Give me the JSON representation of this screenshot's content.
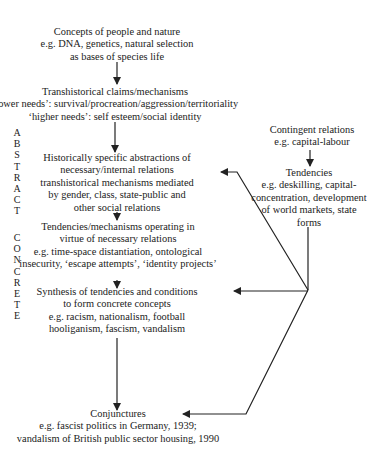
{
  "diagram": {
    "nodes": {
      "concepts": {
        "title": "Concepts of people and nature",
        "lines": [
          "e.g. DNA, genetics, natural selection",
          "as bases of species life"
        ]
      },
      "transhistorical": {
        "title": "Transhistorical claims/mechanisms",
        "lines": [
          "‘lower needs’: survival/procreation/aggression/territoriality",
          "‘higher needs’: self esteem/social identity"
        ]
      },
      "historically_specific": {
        "title": "Historically specific abstractions of",
        "lines": [
          "necessary/internal relations",
          "transhistorical mechanisms mediated",
          "by gender, class, state-public and",
          "other social relations"
        ]
      },
      "tendencies_mechanisms": {
        "title": "Tendencies/mechanisms operating in",
        "lines": [
          "virtue of necessary relations",
          "e.g. time-space distantiation, ontological",
          "insecurity, ‘escape attempts’, ‘identity projects’"
        ]
      },
      "synthesis": {
        "title": "Synthesis of tendencies and conditions",
        "lines": [
          "to form concrete concepts",
          "e.g. racism, nationalism, football",
          "hooliganism, fascism, vandalism"
        ]
      },
      "conjunctures": {
        "title": "Conjunctures",
        "lines": [
          "e.g. fascist politics in Germany, 1939;",
          "vandalism of British public sector housing, 1990"
        ]
      },
      "contingent": {
        "title": "Contingent relations",
        "lines": [
          "e.g. capital-labour"
        ]
      },
      "tendencies_right": {
        "title": "Tendencies",
        "lines": [
          "e.g. deskilling, capital-",
          "concentration, development",
          "of world markets, state",
          "forms"
        ]
      }
    },
    "axis_labels": {
      "abstract": [
        "A",
        "B",
        "S",
        "T",
        "R",
        "A",
        "C",
        "T"
      ],
      "concrete": [
        "C",
        "O",
        "N",
        "C",
        "R",
        "E",
        "T",
        "E"
      ]
    },
    "edges": [
      {
        "from": "concepts",
        "to": "transhistorical"
      },
      {
        "from": "transhistorical",
        "to": "historically_specific"
      },
      {
        "from": "historically_specific",
        "to": "tendencies_mechanisms"
      },
      {
        "from": "tendencies_mechanisms",
        "to": "synthesis"
      },
      {
        "from": "synthesis",
        "to": "conjunctures"
      },
      {
        "from": "contingent",
        "to": "tendencies_right"
      },
      {
        "from": "tendencies_right",
        "to": "historically_specific"
      },
      {
        "from": "tendencies_right",
        "to": "synthesis"
      },
      {
        "from": "tendencies_right",
        "to": "conjunctures"
      }
    ],
    "colors": {
      "ink": "#222222",
      "background": "#ffffff"
    }
  }
}
